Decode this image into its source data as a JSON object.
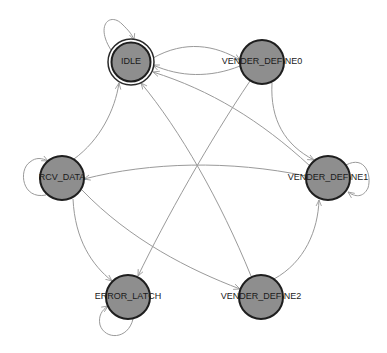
{
  "diagram": {
    "type": "state-machine",
    "colors": {
      "background": "#ffffff",
      "node_fill": "#8e8e8e",
      "node_stroke": "#1e1e1e",
      "edge": "#9a9a9a",
      "label": "#1a1a1a"
    },
    "nodes": [
      {
        "id": "IDLE",
        "label": "IDLE",
        "x": 131,
        "y": 62,
        "initial": true
      },
      {
        "id": "VENDER_DEFINE0",
        "label": "VENDER_DEFINE0",
        "x": 262,
        "y": 62
      },
      {
        "id": "RCV_DATA",
        "label": "RCV_DATA",
        "x": 62,
        "y": 178
      },
      {
        "id": "VENDER_DEFINE1",
        "label": "VENDER_DEFINE1",
        "x": 328,
        "y": 178
      },
      {
        "id": "ERROR_LATCH",
        "label": "ERROR_LATCH",
        "x": 128,
        "y": 297
      },
      {
        "id": "VENDER_DEFINE2",
        "label": "VENDER_DEFINE2",
        "x": 261,
        "y": 297
      }
    ],
    "edges": [
      {
        "from": "IDLE",
        "to": "IDLE"
      },
      {
        "from": "IDLE",
        "to": "VENDER_DEFINE0"
      },
      {
        "from": "VENDER_DEFINE0",
        "to": "IDLE"
      },
      {
        "from": "VENDER_DEFINE1",
        "to": "IDLE"
      },
      {
        "from": "VENDER_DEFINE2",
        "to": "IDLE"
      },
      {
        "from": "RCV_DATA",
        "to": "IDLE"
      },
      {
        "from": "VENDER_DEFINE0",
        "to": "VENDER_DEFINE1"
      },
      {
        "from": "VENDER_DEFINE0",
        "to": "ERROR_LATCH"
      },
      {
        "from": "VENDER_DEFINE1",
        "to": "RCV_DATA"
      },
      {
        "from": "VENDER_DEFINE1",
        "to": "VENDER_DEFINE1"
      },
      {
        "from": "RCV_DATA",
        "to": "RCV_DATA"
      },
      {
        "from": "RCV_DATA",
        "to": "ERROR_LATCH"
      },
      {
        "from": "RCV_DATA",
        "to": "VENDER_DEFINE2"
      },
      {
        "from": "VENDER_DEFINE2",
        "to": "VENDER_DEFINE1"
      },
      {
        "from": "ERROR_LATCH",
        "to": "ERROR_LATCH"
      }
    ]
  }
}
